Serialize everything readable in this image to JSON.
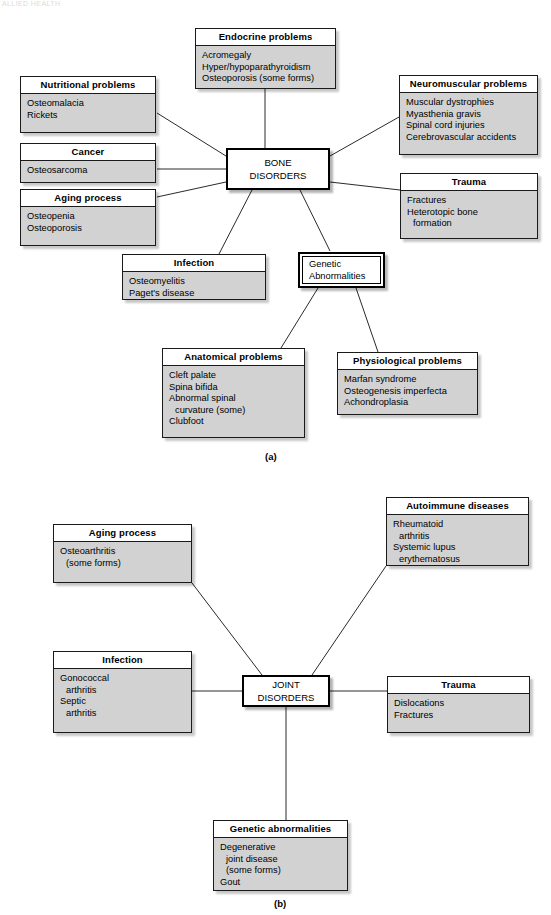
{
  "watermark": "ALLIED HEALTH",
  "panel_a": {
    "label": "(a)",
    "hub": {
      "line1": "BONE",
      "line2": "DISORDERS"
    },
    "boxes": [
      {
        "key": "endocrine",
        "title": "Endocrine problems",
        "items": [
          {
            "text": "Acromegaly",
            "indent": false
          },
          {
            "text": "Hyper/hypoparathyroidism",
            "indent": false
          },
          {
            "text": "Osteoporosis (some forms)",
            "indent": false
          }
        ]
      },
      {
        "key": "nutritional",
        "title": "Nutritional problems",
        "items": [
          {
            "text": "Osteomalacia",
            "indent": false
          },
          {
            "text": "Rickets",
            "indent": false
          }
        ]
      },
      {
        "key": "cancer",
        "title": "Cancer",
        "items": [
          {
            "text": "Osteosarcoma",
            "indent": false
          }
        ]
      },
      {
        "key": "aging",
        "title": "Aging process",
        "items": [
          {
            "text": "Osteopenia",
            "indent": false
          },
          {
            "text": "Osteoporosis",
            "indent": false
          }
        ]
      },
      {
        "key": "neuromuscular",
        "title": "Neuromuscular problems",
        "items": [
          {
            "text": "Muscular dystrophies",
            "indent": false
          },
          {
            "text": "Myasthenia gravis",
            "indent": false
          },
          {
            "text": "Spinal cord injuries",
            "indent": false
          },
          {
            "text": "Cerebrovascular accidents",
            "indent": false
          }
        ]
      },
      {
        "key": "trauma",
        "title": "Trauma",
        "items": [
          {
            "text": "Fractures",
            "indent": false
          },
          {
            "text": "Heterotopic bone",
            "indent": false
          },
          {
            "text": "formation",
            "indent": true
          }
        ]
      },
      {
        "key": "infection",
        "title": "Infection",
        "items": [
          {
            "text": "Osteomyelitis",
            "indent": false
          },
          {
            "text": "Paget's disease",
            "indent": false
          }
        ]
      },
      {
        "key": "anatomical",
        "title": "Anatomical problems",
        "items": [
          {
            "text": "Cleft palate",
            "indent": false
          },
          {
            "text": "Spina bifida",
            "indent": false
          },
          {
            "text": "Abnormal spinal",
            "indent": false
          },
          {
            "text": "curvature (some)",
            "indent": true
          },
          {
            "text": "Clubfoot",
            "indent": false
          }
        ]
      },
      {
        "key": "physiological",
        "title": "Physiological problems",
        "items": [
          {
            "text": "Marfan syndrome",
            "indent": false
          },
          {
            "text": "Osteogenesis imperfecta",
            "indent": false
          },
          {
            "text": "Achondroplasia",
            "indent": false
          }
        ]
      }
    ],
    "genetic_node": {
      "line1": "Genetic",
      "line2": "Abnormalities"
    }
  },
  "panel_b": {
    "label": "(b)",
    "hub": {
      "line1": "JOINT",
      "line2": "DISORDERS"
    },
    "boxes": [
      {
        "key": "autoimmune",
        "title": "Autoimmune diseases",
        "items": [
          {
            "text": "Rheumatoid",
            "indent": false
          },
          {
            "text": "arthritis",
            "indent": true
          },
          {
            "text": "Systemic lupus",
            "indent": false
          },
          {
            "text": "erythematosus",
            "indent": true
          }
        ]
      },
      {
        "key": "aging",
        "title": "Aging process",
        "items": [
          {
            "text": "Osteoarthritis",
            "indent": false
          },
          {
            "text": "(some forms)",
            "indent": true
          }
        ]
      },
      {
        "key": "infection",
        "title": "Infection",
        "items": [
          {
            "text": "Gonococcal",
            "indent": false
          },
          {
            "text": "arthritis",
            "indent": true
          },
          {
            "text": "Septic",
            "indent": false
          },
          {
            "text": "arthritis",
            "indent": true
          }
        ]
      },
      {
        "key": "trauma",
        "title": "Trauma",
        "items": [
          {
            "text": "Dislocations",
            "indent": false
          },
          {
            "text": "Fractures",
            "indent": false
          }
        ]
      },
      {
        "key": "genetic",
        "title": "Genetic abnormalities",
        "items": [
          {
            "text": "Degenerative",
            "indent": false
          },
          {
            "text": "joint disease",
            "indent": true
          },
          {
            "text": "(some forms)",
            "indent": true
          },
          {
            "text": "Gout",
            "indent": false
          }
        ]
      }
    ]
  },
  "colors": {
    "box_fill": "#d2d2d2",
    "header_fill": "#ffffff",
    "stroke": "#1a1a1a",
    "page_bg": "#ffffff"
  }
}
